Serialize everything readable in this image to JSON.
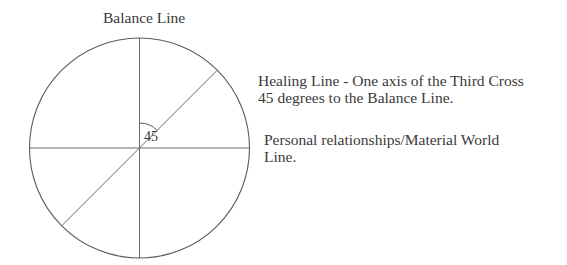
{
  "diagram": {
    "title": "Balance Line",
    "angle_label": "45",
    "annotations": {
      "healing_line": {
        "line1": "Healing Line - One axis of the Third Cross",
        "line2": "45 degrees to the Balance Line."
      },
      "personal_line": {
        "line1": "Personal relationships/Material World",
        "line2": "Line."
      }
    },
    "geometry": {
      "center": [
        139.5,
        148
      ],
      "radius": 110,
      "angle_degrees": 45
    },
    "colors": {
      "line": "#5a5a5a",
      "text": "#3a3a3a"
    }
  }
}
